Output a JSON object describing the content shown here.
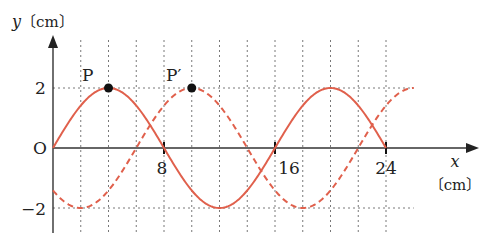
{
  "chart_data": {
    "type": "line",
    "title": "",
    "xlabel": "x",
    "xunit": "〔cm〕",
    "ylabel": "y",
    "yunit": "〔cm〕",
    "origin_label": "O",
    "x_ticks": [
      8,
      16,
      24
    ],
    "y_ticks": [
      2,
      -2
    ],
    "xlim": [
      0,
      26
    ],
    "ylim": [
      -2,
      2
    ],
    "grid": {
      "vertical_every": 2,
      "vertical_to": 24,
      "horizontal_at": [
        2,
        -2
      ]
    },
    "series": [
      {
        "name": "solid wave",
        "style": "solid",
        "color": "#e0604c",
        "formula": "y = 2 sin(2πx/16)",
        "amplitude": 2,
        "wavelength": 16,
        "x_range": [
          0,
          24
        ],
        "x": [
          0,
          4,
          8,
          12,
          16,
          20,
          24
        ],
        "y": [
          0,
          2,
          0,
          -2,
          0,
          2,
          0
        ]
      },
      {
        "name": "dashed wave (shifted by 6 cm)",
        "style": "dashed",
        "color": "#e0604c",
        "formula": "y = 2 sin(2π(x-6)/16)",
        "amplitude": 2,
        "wavelength": 16,
        "x_range": [
          0,
          26
        ],
        "x": [
          0,
          2,
          6,
          10,
          14,
          18,
          22,
          26
        ],
        "y": [
          -1.41,
          -2,
          0,
          2,
          0,
          -2,
          0,
          2
        ]
      }
    ],
    "annotations": [
      {
        "label": "P",
        "x": 4,
        "y": 2,
        "marker": "dot"
      },
      {
        "label": "P′",
        "x": 10,
        "y": 2,
        "marker": "dot"
      }
    ]
  },
  "labels": {
    "y_axis": "y",
    "y_unit": "〔cm〕",
    "x_axis": "x",
    "x_unit": "〔cm〕",
    "origin": "O",
    "tick_2": "2",
    "tick_neg2": "−2",
    "tick_8": "8",
    "tick_16": "16",
    "tick_24": "24",
    "point_p": "P",
    "point_p_prime": "P′"
  },
  "colors": {
    "wave": "#e0604c",
    "axis": "#333333",
    "grid": "#555555"
  }
}
